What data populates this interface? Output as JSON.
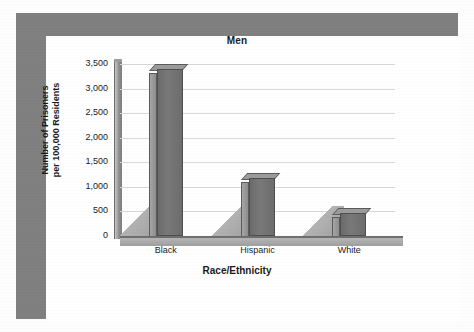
{
  "chart_data": {
    "type": "bar",
    "title": "Men",
    "xlabel": "Race/Ethnicity",
    "ylabel": "Number of Prisoners per 100,000 Residents",
    "ylabel_line1": "Number of Prisoners",
    "ylabel_line2": "per 100,000 Residents",
    "categories": [
      "Black",
      "Hispanic",
      "White"
    ],
    "values": [
      3400,
      1180,
      460
    ],
    "ylim": [
      0,
      3500
    ],
    "ytick_values": [
      0,
      500,
      1000,
      1500,
      2000,
      2500,
      3000,
      3500
    ],
    "ytick_labels": [
      "0",
      "500",
      "1,000",
      "1,500",
      "2,000",
      "2,500",
      "3,000",
      "3,500"
    ],
    "grid": true,
    "legend": "none",
    "style": "3d-column",
    "series": [
      {
        "name": "Number of Prisoners per 100,000 Residents",
        "values": [
          3400,
          1180,
          460
        ]
      }
    ]
  },
  "colors": {
    "frame": "#808080",
    "plot_background": "#ffffff",
    "bar_front": "#6f6f6f",
    "bar_side": "#9a9a9a",
    "bar_top": "#9b9b9b",
    "gridline": "#d8d8d8",
    "axis": "#7d7d7d",
    "text": "#1a1a1a"
  }
}
